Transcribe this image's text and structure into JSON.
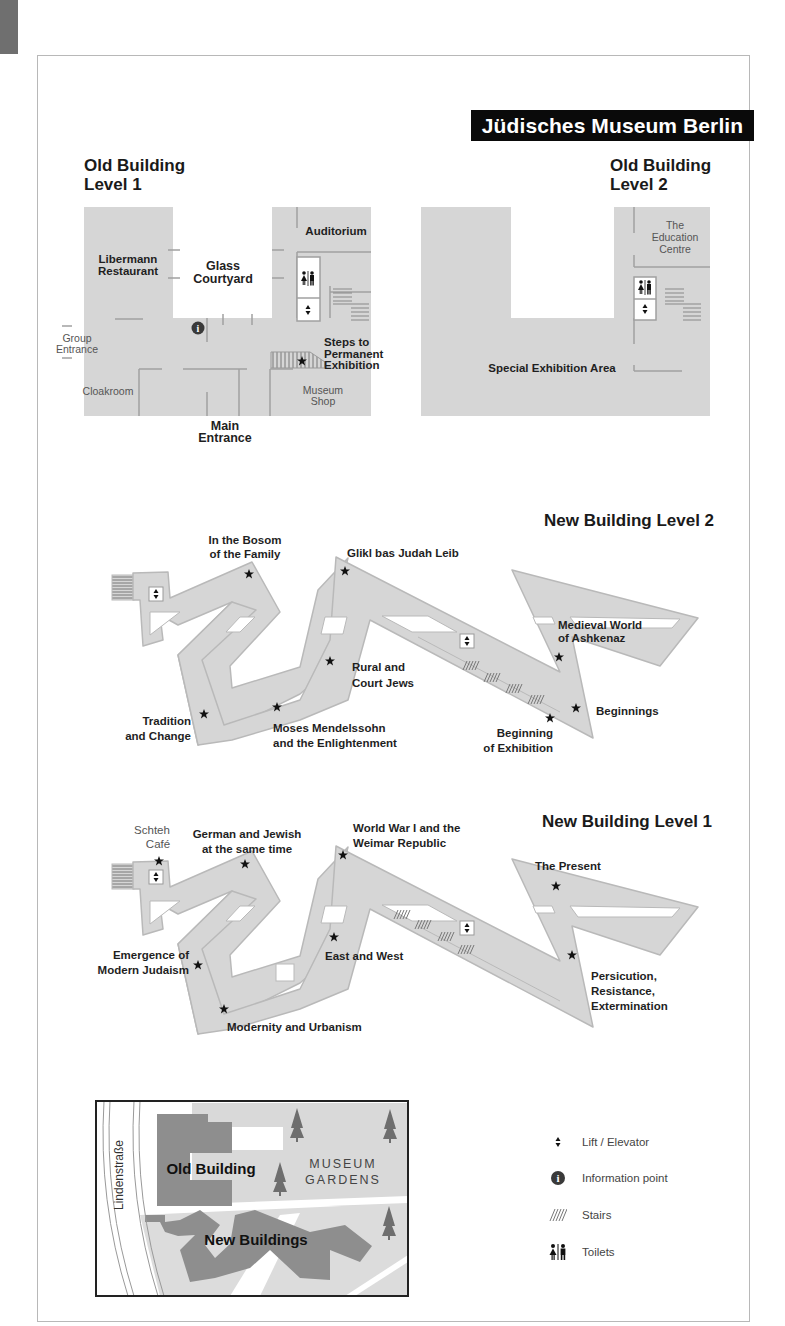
{
  "header": {
    "title": "Jüdisches Museum Berlin"
  },
  "colors": {
    "floor_fill": "#d6d6d6",
    "floor_outline": "#b9b9b9",
    "wall": "#9a9a9a",
    "title_bg": "#0a0a0a",
    "title_fg": "#ffffff",
    "building_dark": "#8e8e8e",
    "garden": "#d9d9d9"
  },
  "old_building_l1": {
    "title_line1": "Old Building",
    "title_line2": "Level 1",
    "labels": {
      "auditorium": "Auditorium",
      "restaurant_1": "Libermann",
      "restaurant_2": "Restaurant",
      "courtyard_1": "Glass",
      "courtyard_2": "Courtyard",
      "group_1": "Group",
      "group_2": "Entrance",
      "steps_1": "Steps to",
      "steps_2": "Permanent",
      "steps_3": "Exhibition",
      "cloakroom": "Cloakroom",
      "shop_1": "Museum",
      "shop_2": "Shop",
      "main_1": "Main",
      "main_2": "Entrance"
    }
  },
  "old_building_l2": {
    "title_line1": "Old Building",
    "title_line2": "Level 2",
    "labels": {
      "edu_1": "The",
      "edu_2": "Education",
      "edu_3": "Centre",
      "special": "Special Exhibition Area"
    }
  },
  "new_building_l2": {
    "title": "New Building Level 2",
    "labels": {
      "bosom_1": "In the Bosom",
      "bosom_2": "of the Family",
      "glikl": "Glikl bas Judah Leib",
      "medieval_1": "Medieval World",
      "medieval_2": "of Ashkenaz",
      "rural_1": "Rural and",
      "rural_2": "Court Jews",
      "tradition_1": "Tradition",
      "tradition_2": "and Change",
      "moses_1": "Moses Mendelssohn",
      "moses_2": "and the Enlightenment",
      "beginnings": "Beginnings",
      "beginning_ex_1": "Beginning",
      "beginning_ex_2": "of Exhibition"
    }
  },
  "new_building_l1": {
    "title": "New Building Level 1",
    "labels": {
      "cafe_1": "Schteh",
      "cafe_2": "Café",
      "german_1": "German and Jewish",
      "german_2": "at the same time",
      "ww1_1": "World War I and the",
      "ww1_2": "Weimar Republic",
      "present": "The Present",
      "emergence_1": "Emergence of",
      "emergence_2": "Modern Judaism",
      "east_west": "East and West",
      "persecution_1": "Persicution,",
      "persecution_2": "Resistance,",
      "persecution_3": "Extermination",
      "modernity": "Modernity and Urbanism"
    }
  },
  "site_map": {
    "street": "Lindenstraße",
    "old_building": "Old Building",
    "gardens_1": "MUSEUM",
    "gardens_2": "GARDENS",
    "new_buildings": "New Buildings"
  },
  "legend": {
    "items": [
      {
        "icon": "lift-icon",
        "glyph": "⬍",
        "label": "Lift / Elevator"
      },
      {
        "icon": "info-icon",
        "glyph": "i",
        "label": "Information point"
      },
      {
        "icon": "stairs-icon",
        "glyph": "////",
        "label": "Stairs"
      },
      {
        "icon": "toilets-icon",
        "glyph": "🚻",
        "label": "Toilets"
      }
    ]
  }
}
